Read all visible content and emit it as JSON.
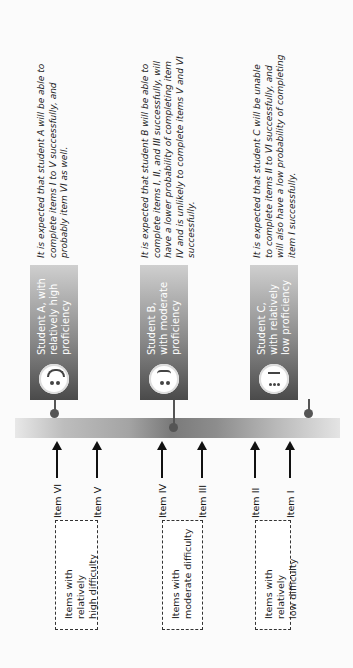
{
  "difficulty_groups": [
    {
      "label_line1": "Items with relatively",
      "label_line2": "high difficulty"
    },
    {
      "label_line1": "Items with",
      "label_line2": "moderate difficulty"
    },
    {
      "label_line1": "Items with relatively",
      "label_line2": "low difficulty"
    }
  ],
  "items": [
    "Item VI",
    "Item V",
    "Item IV",
    "Item III",
    "Item II",
    "Item I"
  ],
  "scale_bar": {
    "gradient": [
      "#e8e8e8",
      "#7a7a7a",
      "#e4e4e4"
    ]
  },
  "students": [
    {
      "label_line1": "Student A, with",
      "label_line2": "relatively high",
      "label_line3": "proficiency",
      "face_icon": "smiling-face",
      "description": "It is expected that student A will be able to complete items I to V successfully, and probably item VI as well."
    },
    {
      "label_line1": "Student B,",
      "label_line2": "with moderate",
      "label_line3": "proficiency",
      "face_icon": "neutral-face",
      "description": "It is expected that student B will be able to complete items I, II, and III successfully, will have a lower probability of completing item IV and is unlikely to complete items V and VI successfully."
    },
    {
      "label_line1": "Student C,",
      "label_line2": "with relatively",
      "label_line3": "low proficiency",
      "face_icon": "worried-face",
      "description": "It is expected that student C will be unable to complete items II to VI successfully, and will also have a low probability of completing item I successfully."
    }
  ]
}
